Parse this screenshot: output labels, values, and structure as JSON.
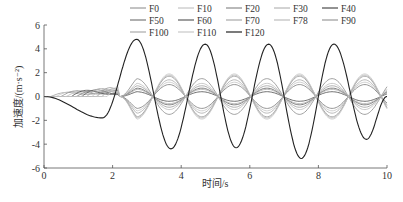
{
  "chart_data": {
    "type": "line",
    "title": "",
    "xlabel": "时间/s",
    "ylabel": "加速度/(m·s⁻²)",
    "xlim": [
      0,
      10
    ],
    "ylim": [
      -6,
      6
    ],
    "xticks": [
      0,
      2,
      4,
      6,
      8,
      10
    ],
    "yticks": [
      -6,
      -4,
      -2,
      0,
      2,
      4,
      6
    ],
    "grid": false,
    "legend_position": "top-right",
    "legend_columns": 5,
    "series": [
      {
        "name": "F0",
        "color": "#9a9a9a",
        "amp": 0.9,
        "start": 0.2
      },
      {
        "name": "F10",
        "color": "#c4c4c4",
        "amp": 1.2,
        "start": 0.35
      },
      {
        "name": "F20",
        "color": "#8a8a8a",
        "amp": 1.5,
        "start": 0.5
      },
      {
        "name": "F30",
        "color": "#b5b5b5",
        "amp": 1.8,
        "start": 0.65
      },
      {
        "name": "F40",
        "color": "#4a4a4a",
        "amp": 0.4,
        "start": 0.8
      },
      {
        "name": "F50",
        "color": "#7a7a7a",
        "amp": 1.0,
        "start": 0.95
      },
      {
        "name": "F60",
        "color": "#5e5e5e",
        "amp": 0.7,
        "start": 1.1
      },
      {
        "name": "F70",
        "color": "#a8a8a8",
        "amp": 1.4,
        "start": 1.25
      },
      {
        "name": "F78",
        "color": "#bdbdbd",
        "amp": 1.1,
        "start": 1.4
      },
      {
        "name": "F90",
        "color": "#999999",
        "amp": 1.7,
        "start": 1.55
      },
      {
        "name": "F100",
        "color": "#aaaaaa",
        "amp": 0.6,
        "start": 1.7
      },
      {
        "name": "F110",
        "color": "#c8c8c8",
        "amp": 1.9,
        "start": 1.85
      },
      {
        "name": "F120",
        "color": "#222222",
        "amp": 4.4,
        "start": 0.0,
        "key_points": [
          {
            "t": 0.0,
            "a": 0.0
          },
          {
            "t": 1.7,
            "a": -1.8
          },
          {
            "t": 2.7,
            "a": 4.8
          },
          {
            "t": 3.7,
            "a": -4.4
          },
          {
            "t": 4.7,
            "a": 4.4
          },
          {
            "t": 5.6,
            "a": -4.3
          },
          {
            "t": 6.55,
            "a": 4.4
          },
          {
            "t": 7.5,
            "a": -5.2
          },
          {
            "t": 8.45,
            "a": 4.4
          },
          {
            "t": 9.4,
            "a": -3.6
          },
          {
            "t": 10.0,
            "a": 0.0
          }
        ]
      }
    ]
  },
  "axes": {
    "x_tick_labels": [
      "0",
      "2",
      "4",
      "6",
      "8",
      "10"
    ],
    "y_tick_labels": [
      "6",
      "4",
      "2",
      "0",
      "-2",
      "-4",
      "-6"
    ]
  }
}
